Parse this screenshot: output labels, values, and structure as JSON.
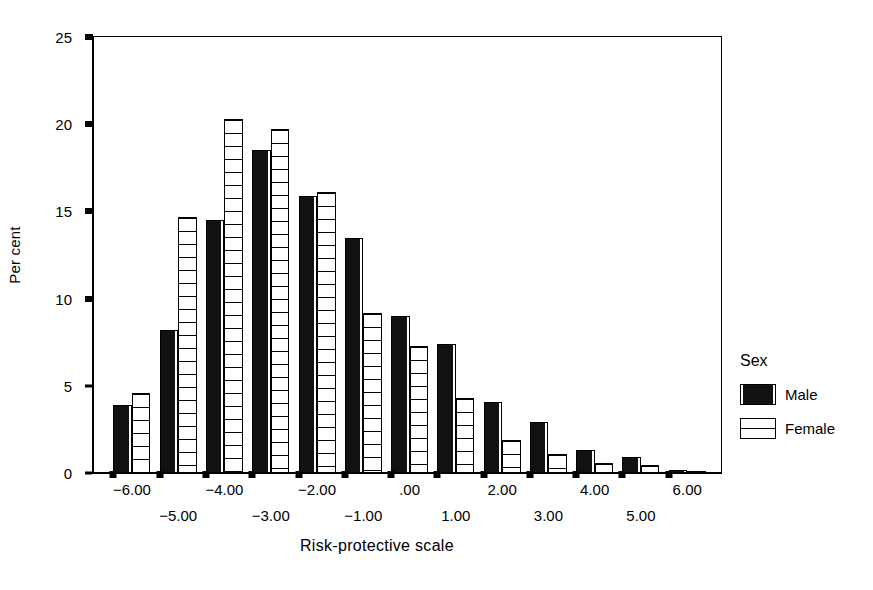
{
  "chart_data": {
    "type": "bar",
    "title": "",
    "xlabel": "Risk-protective scale",
    "ylabel": "Per cent",
    "ylim": [
      0,
      25
    ],
    "yticks": [
      0,
      5,
      10,
      15,
      20,
      25
    ],
    "ytick_labels": [
      "0",
      "5",
      "10",
      "15",
      "20",
      "25"
    ],
    "grid": false,
    "legend_position": "right",
    "legend_title": "Sex",
    "categories": [
      "-6.00",
      "-5.00",
      "-4.00",
      "-3.00",
      "-2.00",
      "-1.00",
      ".00",
      "1.00",
      "2.00",
      "3.00",
      "4.00",
      "5.00",
      "6.00"
    ],
    "xtick_labels_row1": [
      "-6.00",
      "-4.00",
      "-2.00",
      ".00",
      "2.00",
      "4.00",
      "6.00"
    ],
    "xtick_labels_row2": [
      "-5.00",
      "-3.00",
      "-1.00",
      "1.00",
      "3.00",
      "5.00"
    ],
    "series": [
      {
        "name": "Male",
        "color": "#111111",
        "pattern": "solid-black",
        "values": [
          3.9,
          8.2,
          14.5,
          18.5,
          15.9,
          13.5,
          9.0,
          7.4,
          4.1,
          2.9,
          1.3,
          0.9,
          0.2
        ]
      },
      {
        "name": "Female",
        "color": "#ffffff",
        "pattern": "horizontal-lines",
        "values": [
          4.6,
          14.7,
          20.3,
          19.7,
          16.1,
          9.2,
          7.3,
          4.3,
          1.9,
          1.1,
          0.55,
          0.45,
          0.1
        ]
      }
    ]
  },
  "legend": {
    "title": "Sex",
    "entries": [
      {
        "label": "Male"
      },
      {
        "label": "Female"
      }
    ]
  },
  "axes": {
    "y_title": "Per cent",
    "x_title": "Risk-protective scale"
  }
}
